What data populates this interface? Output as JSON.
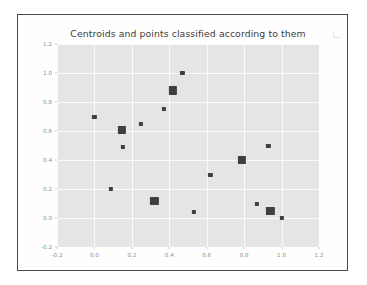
{
  "chart_data": {
    "type": "scatter",
    "title": "Centroids and points classified according to them",
    "xlabel": "",
    "ylabel": "",
    "xlim": [
      -0.2,
      1.2
    ],
    "ylim": [
      -0.2,
      1.2
    ],
    "grid": true,
    "legend": "none",
    "xticks": [
      "-0.2",
      "0.0",
      "0.2",
      "0.4",
      "0.6",
      "0.8",
      "1.0",
      "1.2"
    ],
    "xtick_values": [
      -0.2,
      0.0,
      0.2,
      0.4,
      0.6,
      0.8,
      1.0,
      1.2
    ],
    "yticks": [
      "-0.2",
      "0.0",
      "0.2",
      "0.4",
      "0.6",
      "0.8",
      "1.0",
      "1.2"
    ],
    "ytick_values": [
      -0.2,
      0.0,
      0.2,
      0.4,
      0.6,
      0.8,
      1.0,
      1.2
    ],
    "background_color": "#e5e5e5",
    "gridline_color": "#fafafa",
    "marker_color": "#3f3f3f",
    "series": [
      {
        "name": "points",
        "marker": "square-small",
        "color": "#3f3f3f",
        "x": [
          0.47,
          0.37,
          0.0,
          0.25,
          0.15,
          0.93,
          0.62,
          0.09,
          0.87,
          0.53,
          1.0
        ],
        "y": [
          1.0,
          0.75,
          0.7,
          0.65,
          0.49,
          0.5,
          0.3,
          0.2,
          0.1,
          0.04,
          0.0
        ]
      },
      {
        "name": "centroids",
        "marker": "square-large",
        "color": "#3f3f3f",
        "x": [
          0.42,
          0.145,
          0.79,
          0.32,
          0.94
        ],
        "y": [
          0.88,
          0.61,
          0.4,
          0.12,
          0.05
        ]
      }
    ]
  }
}
